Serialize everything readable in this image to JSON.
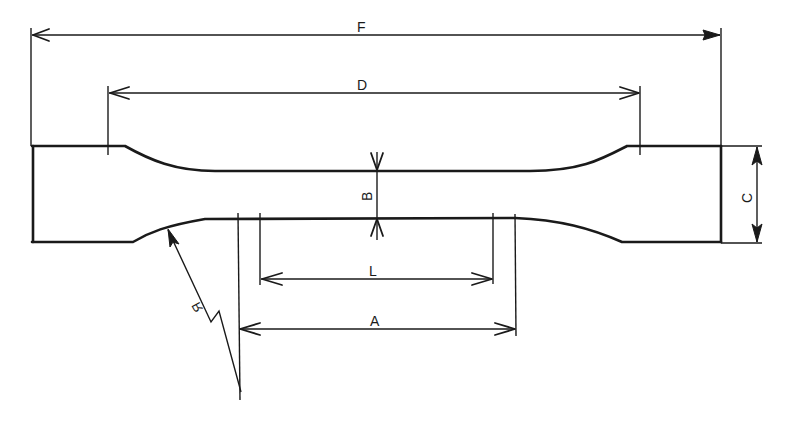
{
  "diagram": {
    "stroke_color": "#1a1a1a",
    "background": "#ffffff",
    "dimensions": {
      "F": {
        "label": "F",
        "meaning": "overall length"
      },
      "D": {
        "label": "D",
        "meaning": "distance between grips"
      },
      "B": {
        "label": "B",
        "meaning": "width of reduced section"
      },
      "C": {
        "label": "C",
        "meaning": "width of grip section"
      },
      "L": {
        "label": "L",
        "meaning": "gauge length"
      },
      "A": {
        "label": "A",
        "meaning": "length of reduced section"
      },
      "R": {
        "label": "R",
        "meaning": "fillet radius"
      }
    }
  }
}
